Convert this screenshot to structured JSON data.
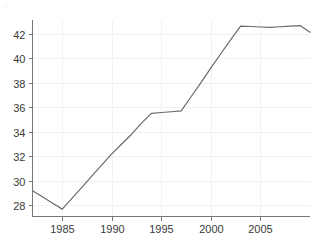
{
  "chart_data": {
    "type": "line",
    "title": "",
    "subtitle": "",
    "xlabel": "",
    "ylabel": "",
    "x": [
      1982,
      1983,
      1984,
      1985,
      1986,
      1987,
      1988,
      1989,
      1990,
      1991,
      1992,
      1993,
      1994,
      1995,
      1996,
      1997,
      1998,
      1999,
      2000,
      2001,
      2002,
      2003,
      2004,
      2005,
      2006,
      2007,
      2008,
      2009,
      2010
    ],
    "values": [
      29.2,
      28.7,
      28.2,
      27.7,
      28.6,
      29.5,
      30.4,
      31.3,
      32.2,
      33.0,
      33.8,
      34.7,
      35.5,
      35.57,
      35.63,
      35.7,
      36.85,
      38.0,
      39.2,
      40.35,
      41.5,
      42.6,
      42.57,
      42.53,
      42.5,
      42.55,
      42.6,
      42.65,
      42.1
    ],
    "series": [
      {
        "name": "series-1",
        "color": "#6a6a6a",
        "values": [
          29.2,
          28.7,
          28.2,
          27.7,
          28.6,
          29.5,
          30.4,
          31.3,
          32.2,
          33.0,
          33.8,
          34.7,
          35.5,
          35.57,
          35.63,
          35.7,
          36.85,
          38.0,
          39.2,
          40.35,
          41.5,
          42.6,
          42.57,
          42.53,
          42.5,
          42.55,
          42.6,
          42.65,
          42.1
        ]
      }
    ],
    "xlim": [
      1982,
      2010
    ],
    "ylim": [
      27.1,
      43.1
    ],
    "x_ticks": [
      1985,
      1990,
      1995,
      2000,
      2005
    ],
    "x_tick_labels": [
      "1985",
      "1990",
      "1995",
      "2000",
      "2005"
    ],
    "y_ticks": [
      28,
      30,
      32,
      34,
      36,
      38,
      40,
      42
    ],
    "y_tick_labels": [
      "28",
      "30",
      "32",
      "34",
      "36",
      "38",
      "40",
      "42"
    ],
    "grid": true,
    "grid_color": "#f0eff3",
    "legend": false,
    "legend_position": "none",
    "annotations": [],
    "axis_color": "#777777",
    "background": "#ffffff"
  }
}
